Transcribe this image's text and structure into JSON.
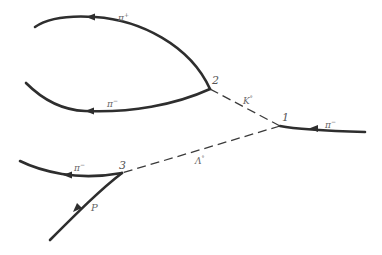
{
  "diagram": {
    "type": "particle-decay-tracks",
    "colors": {
      "track": "#2e2e2e",
      "neutral": "#3a3a3a",
      "label": "#666666"
    },
    "vertices": [
      {
        "id": "1",
        "label": "1"
      },
      {
        "id": "2",
        "label": "2"
      },
      {
        "id": "3",
        "label": "3"
      }
    ],
    "tracks": [
      {
        "id": "incoming-pi-minus",
        "particle": "π",
        "charge": "−",
        "to_vertex": "1",
        "style": "solid"
      },
      {
        "id": "k0",
        "particle": "K",
        "charge": "°",
        "from_vertex": "1",
        "to_vertex": "2",
        "style": "dashed"
      },
      {
        "id": "lambda0",
        "particle": "Λ",
        "charge": "°",
        "from_vertex": "1",
        "to_vertex": "3",
        "style": "dashed"
      },
      {
        "id": "pi-plus-from-2",
        "particle": "π",
        "charge": "+",
        "from_vertex": "2",
        "style": "solid"
      },
      {
        "id": "pi-minus-from-2",
        "particle": "π",
        "charge": "−",
        "from_vertex": "2",
        "style": "solid"
      },
      {
        "id": "pi-minus-from-3",
        "particle": "π",
        "charge": "−",
        "from_vertex": "3",
        "style": "solid"
      },
      {
        "id": "proton-from-3",
        "particle": "P",
        "charge": "",
        "from_vertex": "3",
        "style": "solid"
      }
    ]
  }
}
